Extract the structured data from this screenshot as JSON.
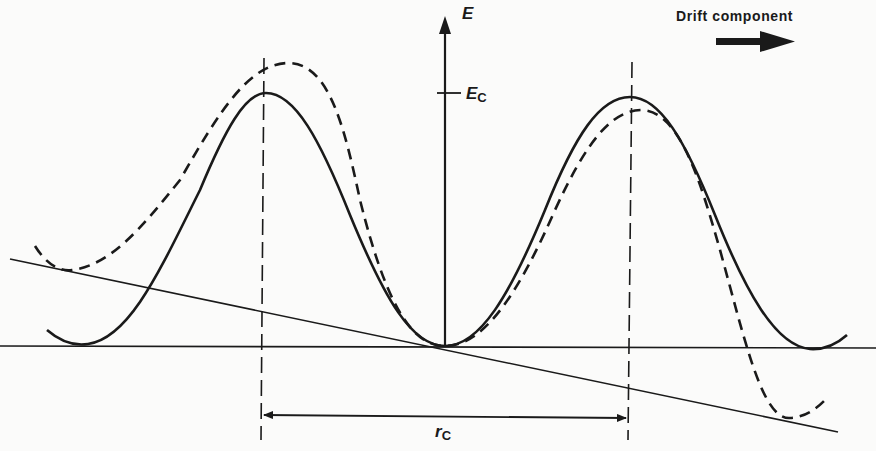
{
  "diagram": {
    "labels": {
      "energy_axis": "E",
      "critical_energy_main": "E",
      "critical_energy_sub": "C",
      "drift": "Drift component",
      "distance_main": "r",
      "distance_sub": "C"
    },
    "curves": [
      {
        "name": "unperturbed-potential",
        "style": "solid",
        "description": "Periodic potential without field"
      },
      {
        "name": "perturbed-potential",
        "style": "dashed",
        "description": "Potential tilted by drift field"
      }
    ],
    "colors": {
      "ink": "#1a1a1a",
      "background": "#fbfbfa"
    }
  }
}
